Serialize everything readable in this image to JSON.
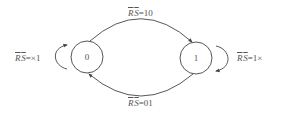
{
  "diagram": {
    "type": "state-transition-diagram",
    "stroke_color": "#444444",
    "text_color": "#555555",
    "states": [
      {
        "id": "s0",
        "label": "0",
        "cx": 87,
        "cy": 57,
        "r": 16
      },
      {
        "id": "s1",
        "label": "1",
        "cx": 196,
        "cy": 58,
        "r": 16
      }
    ],
    "transitions": [
      {
        "from": "0",
        "to": "1",
        "position": "top",
        "label": {
          "r": "R",
          "s": "S",
          "rest": "=10"
        }
      },
      {
        "from": "1",
        "to": "0",
        "position": "bottom",
        "label": {
          "r": "R",
          "s": "S",
          "rest": "=01"
        }
      },
      {
        "from": "0",
        "to": "0",
        "position": "left-self-loop",
        "label": {
          "r": "R",
          "s": "S",
          "rest": "=×1"
        }
      },
      {
        "from": "1",
        "to": "1",
        "position": "right-self-loop",
        "label": {
          "r": "R",
          "s": "S",
          "rest": "=1×"
        }
      }
    ]
  }
}
